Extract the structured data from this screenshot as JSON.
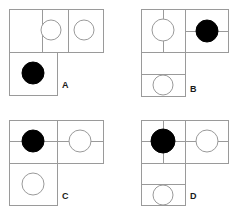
{
  "figure": {
    "type": "visual-reasoning-options",
    "option_count": 4,
    "stroke_color": "#9a9a9a",
    "fill_black": "#000000",
    "fill_white": "#ffffff",
    "background": "#ffffff",
    "label_color": "#1a1a1a"
  },
  "panels": [
    {
      "id": "A",
      "label": "A",
      "label_x": 62,
      "label_y": 81,
      "origin_x": 7,
      "origin_y": 7,
      "width": 94,
      "height": 86,
      "cells": [
        {
          "name": "top-left",
          "x": 0,
          "y": 0,
          "w": 33,
          "h": 43
        },
        {
          "name": "top-mid",
          "x": 33,
          "y": 0,
          "w": 26,
          "h": 43
        },
        {
          "name": "top-right",
          "x": 59,
          "y": 0,
          "w": 35,
          "h": 43
        },
        {
          "name": "bottom-left",
          "x": 0,
          "y": 43,
          "w": 48,
          "h": 43
        }
      ],
      "dividers": [
        {
          "orient": "vertical",
          "x": 33,
          "y1": 0,
          "y2": 43
        },
        {
          "orient": "vertical",
          "x": 59,
          "y1": 0,
          "y2": 43
        },
        {
          "orient": "horizontal",
          "y": 43,
          "x1": 0,
          "x2": 94
        },
        {
          "orient": "vertical",
          "x": 48,
          "y1": 43,
          "y2": 86
        }
      ],
      "circles": [
        {
          "cx": 42,
          "cy": 21,
          "r": 10,
          "fill": "white",
          "name": "white-circle-top-mid"
        },
        {
          "cx": 75,
          "cy": 21,
          "r": 10,
          "fill": "white",
          "name": "white-circle-top-right"
        },
        {
          "cx": 24,
          "cy": 64,
          "r": 11,
          "fill": "black",
          "name": "black-circle-bottom-left"
        }
      ]
    },
    {
      "id": "B",
      "label": "B",
      "label_x": 190,
      "label_y": 85,
      "origin_x": 139,
      "origin_y": 7,
      "width": 87,
      "height": 87,
      "cells": [
        {
          "name": "left-top",
          "x": 0,
          "y": 0,
          "w": 44,
          "h": 43
        },
        {
          "name": "right-top",
          "x": 44,
          "y": 0,
          "w": 43,
          "h": 43
        },
        {
          "name": "left-middle",
          "x": 0,
          "y": 43,
          "w": 44,
          "h": 22
        },
        {
          "name": "left-bottom",
          "x": 0,
          "y": 65,
          "w": 44,
          "h": 22
        }
      ],
      "dividers": [
        {
          "orient": "vertical",
          "x": 44,
          "y1": 0,
          "y2": 43
        },
        {
          "orient": "vertical",
          "x": 22,
          "y1": 0,
          "y2": 43
        },
        {
          "orient": "horizontal",
          "y": 22,
          "x1": 44,
          "x2": 87
        },
        {
          "orient": "horizontal",
          "y": 43,
          "x1": 0,
          "x2": 87
        },
        {
          "orient": "horizontal",
          "y": 65,
          "x1": 0,
          "x2": 44
        }
      ],
      "circles": [
        {
          "cx": 22,
          "cy": 21,
          "r": 11,
          "fill": "white",
          "name": "white-circle-left-top"
        },
        {
          "cx": 66,
          "cy": 22,
          "r": 11,
          "fill": "black",
          "name": "black-circle-right-top"
        },
        {
          "cx": 22,
          "cy": 76,
          "r": 10,
          "fill": "white",
          "name": "white-circle-left-bottom"
        }
      ]
    },
    {
      "id": "C",
      "label": "C",
      "label_x": 62,
      "label_y": 192,
      "origin_x": 7,
      "origin_y": 118,
      "width": 94,
      "height": 85,
      "cells": [
        {
          "name": "top-left",
          "x": 0,
          "y": 0,
          "w": 48,
          "h": 43
        },
        {
          "name": "top-right",
          "x": 48,
          "y": 0,
          "w": 46,
          "h": 43
        },
        {
          "name": "bottom-left",
          "x": 0,
          "y": 43,
          "w": 48,
          "h": 42
        }
      ],
      "dividers": [
        {
          "orient": "vertical",
          "x": 48,
          "y1": 0,
          "y2": 43
        },
        {
          "orient": "horizontal",
          "y": 21,
          "x1": 0,
          "x2": 94
        },
        {
          "orient": "horizontal",
          "y": 43,
          "x1": 0,
          "x2": 94
        },
        {
          "orient": "vertical",
          "x": 48,
          "y1": 43,
          "y2": 85
        }
      ],
      "circles": [
        {
          "cx": 24,
          "cy": 21,
          "r": 11,
          "fill": "black",
          "name": "black-circle-top-left"
        },
        {
          "cx": 71,
          "cy": 21,
          "r": 11,
          "fill": "white",
          "name": "white-circle-top-right"
        },
        {
          "cx": 24,
          "cy": 64,
          "r": 11,
          "fill": "white",
          "name": "white-circle-bottom-left"
        }
      ]
    },
    {
      "id": "D",
      "label": "D",
      "label_x": 190,
      "label_y": 192,
      "origin_x": 139,
      "origin_y": 118,
      "width": 87,
      "height": 85,
      "cells": [
        {
          "name": "left-top",
          "x": 0,
          "y": 0,
          "w": 44,
          "h": 43
        },
        {
          "name": "right-top",
          "x": 44,
          "y": 0,
          "w": 43,
          "h": 43
        },
        {
          "name": "left-middle",
          "x": 0,
          "y": 43,
          "w": 44,
          "h": 21
        },
        {
          "name": "left-bottom",
          "x": 0,
          "y": 64,
          "w": 44,
          "h": 21
        }
      ],
      "dividers": [
        {
          "orient": "vertical",
          "x": 44,
          "y1": 0,
          "y2": 43
        },
        {
          "orient": "vertical",
          "x": 22,
          "y1": 0,
          "y2": 43
        },
        {
          "orient": "horizontal",
          "y": 21,
          "x1": 0,
          "x2": 87
        },
        {
          "orient": "horizontal",
          "y": 43,
          "x1": 0,
          "x2": 87
        },
        {
          "orient": "horizontal",
          "y": 64,
          "x1": 0,
          "x2": 44
        }
      ],
      "circles": [
        {
          "cx": 22,
          "cy": 21,
          "r": 12,
          "fill": "black",
          "name": "black-circle-left-top"
        },
        {
          "cx": 66,
          "cy": 21,
          "r": 11,
          "fill": "white",
          "name": "white-circle-right-top"
        },
        {
          "cx": 22,
          "cy": 75,
          "r": 10,
          "fill": "white",
          "name": "white-circle-left-bottom"
        }
      ]
    }
  ]
}
